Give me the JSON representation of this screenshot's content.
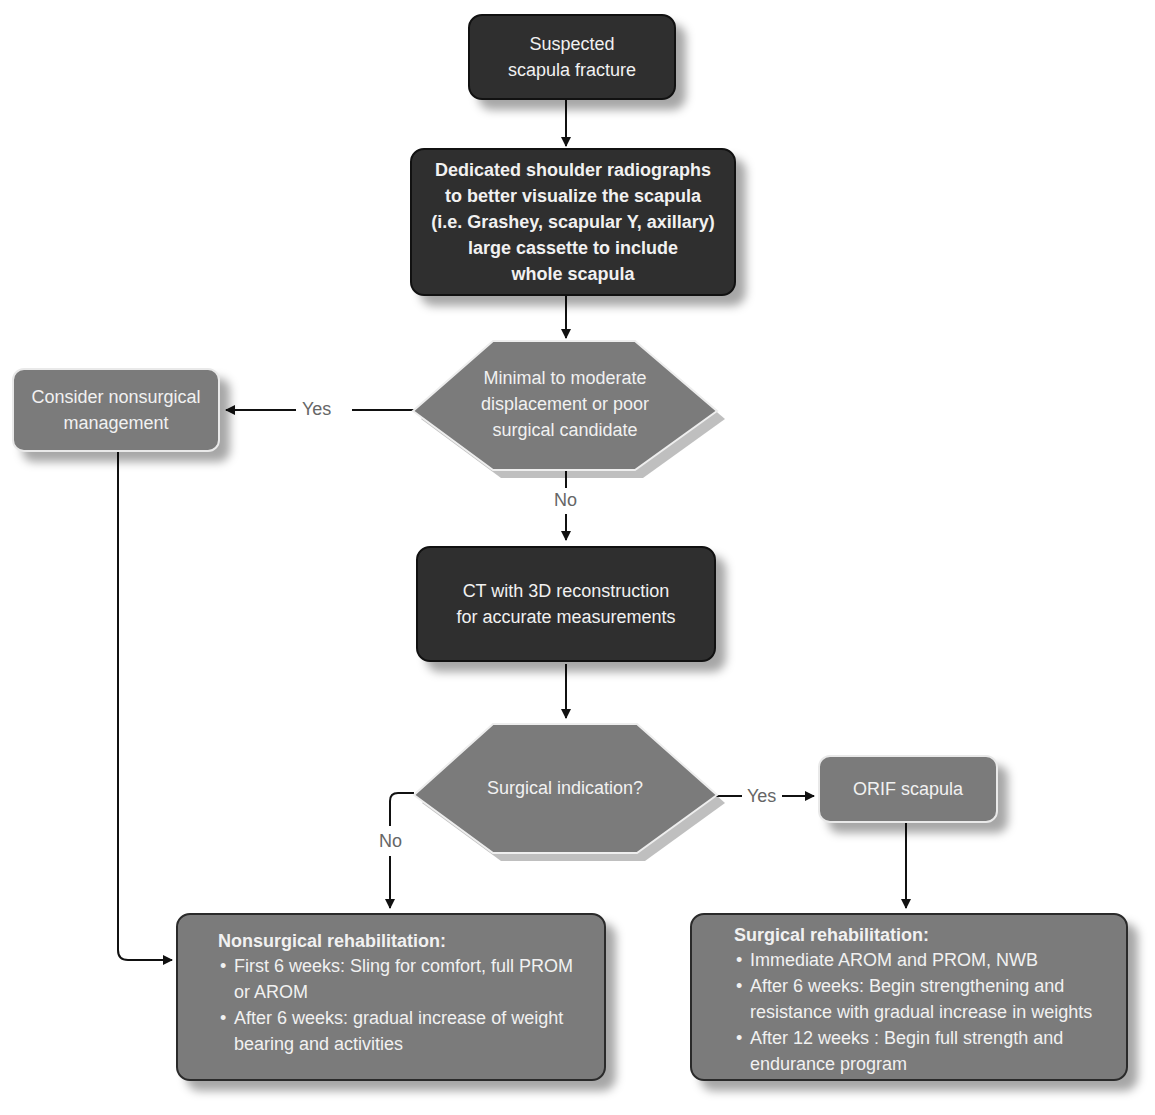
{
  "nodes": {
    "start": {
      "text": "Suspected scapula fracture"
    },
    "radiographs": {
      "lines": [
        "Dedicated shoulder radiographs",
        "to better visualize the scapula",
        "(i.e. Grashey, scapular Y, axillary)",
        "large cassette to include",
        "whole scapula"
      ]
    },
    "decision_displacement": {
      "lines": [
        "Minimal to moderate",
        "displacement or poor",
        "surgical candidate"
      ]
    },
    "nonsurgical_mgmt": {
      "lines": [
        "Consider nonsurgical",
        "management"
      ]
    },
    "ct": {
      "lines": [
        "CT with 3D reconstruction",
        "for accurate measurements"
      ]
    },
    "decision_surgical": {
      "text": "Surgical indication?"
    },
    "orif": {
      "text": "ORIF scapula"
    },
    "nonsurgical_rehab": {
      "title": "Nonsurgical rehabilitation:",
      "items": [
        "First 6 weeks: Sling for comfort, full PROM or AROM",
        "After 6 weeks: gradual increase of weight bearing and activities"
      ]
    },
    "surgical_rehab": {
      "title": "Surgical rehabilitation:",
      "items": [
        "Immediate AROM and PROM, NWB",
        "After 6 weeks: Begin strengthening and resistance with gradual increase in weights",
        "After 12 weeks : Begin full strength and endurance program"
      ]
    }
  },
  "edge_labels": {
    "yes1": "Yes",
    "no1": "No",
    "yes2": "Yes",
    "no2": "No"
  },
  "colors": {
    "dark_node": "#2f2f2f",
    "gray_node": "#7b7b7b",
    "arrow": "#111111",
    "label": "#666666"
  }
}
